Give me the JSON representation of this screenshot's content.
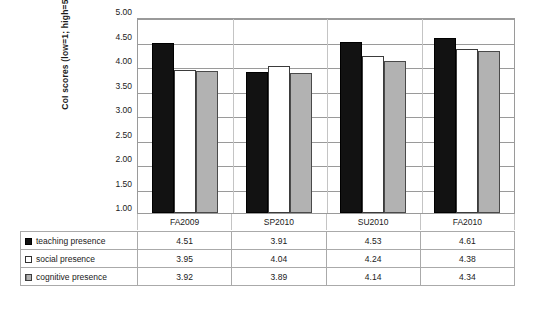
{
  "chart_data": {
    "type": "bar",
    "title": "",
    "xlabel": "",
    "ylabel": "CoI scores (low=1; high=5)",
    "categories": [
      "FA2009",
      "SP2010",
      "SU2010",
      "FA2010"
    ],
    "series": [
      {
        "name": "teaching presence",
        "values": [
          4.51,
          3.91,
          4.53,
          4.61
        ],
        "color": "#121212"
      },
      {
        "name": "social presence",
        "values": [
          3.95,
          4.04,
          4.24,
          4.38
        ],
        "color": "#ffffff"
      },
      {
        "name": "cognitive presence",
        "values": [
          3.92,
          3.89,
          4.14,
          4.34
        ],
        "color": "#b2b2b2"
      }
    ],
    "ylim": [
      1.0,
      5.0
    ],
    "ytick_labels": [
      "5.00",
      "4.50",
      "4.00",
      "3.50",
      "3.00",
      "2.50",
      "2.00",
      "1.50",
      "1.00"
    ],
    "ytick_values": [
      5.0,
      4.5,
      4.0,
      3.5,
      3.0,
      2.5,
      2.0,
      1.5,
      1.0
    ],
    "grid": true,
    "legend_position": "data-table-below"
  },
  "data_table": {
    "header_row": [
      "",
      "FA2009",
      "SP2010",
      "SU2010",
      "FA2010"
    ],
    "rows": [
      {
        "marker": "filled-square",
        "label": "teaching presence",
        "values": [
          "4.51",
          "3.95",
          "4.53",
          "4.61"
        ]
      },
      {
        "marker": "open-square",
        "label": "social presence",
        "values": [
          "3.95",
          "4.04",
          "4.24",
          "4.38"
        ]
      },
      {
        "marker": "hatched-square",
        "label": "cognitive presence",
        "values": [
          "3.92",
          "3.89",
          "4.14",
          "4.34"
        ]
      }
    ]
  },
  "table_display": {
    "r0": {
      "label": "teaching presence",
      "c0": "4.51",
      "c1": "3.91",
      "c2": "4.53",
      "c3": "4.61"
    },
    "r1": {
      "label": "social presence",
      "c0": "3.95",
      "c1": "4.04",
      "c2": "4.24",
      "c3": "4.38"
    },
    "r2": {
      "label": "cognitive presence",
      "c0": "3.92",
      "c1": "3.89",
      "c2": "4.14",
      "c3": "4.34"
    }
  }
}
